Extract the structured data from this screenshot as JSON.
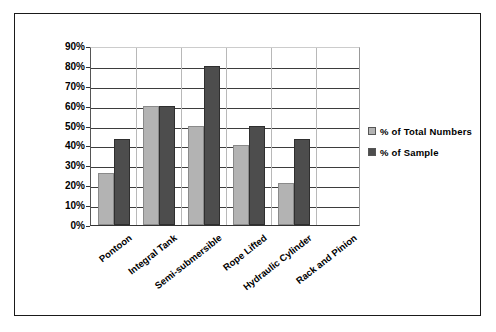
{
  "chart_data": {
    "type": "bar",
    "title": "",
    "xlabel": "",
    "ylabel": "",
    "categories": [
      "Pontoon",
      "Integral Tank",
      "Semi-submersible",
      "Rope Lifted",
      "Hydraulic Cylinder",
      "Rack and Pinion"
    ],
    "series": [
      {
        "name": "% of Total Numbers",
        "color": "#b3b3b3",
        "values": [
          26,
          60,
          50,
          40,
          21,
          0
        ]
      },
      {
        "name": "% of Sample",
        "color": "#4d4d4d",
        "values": [
          43,
          60,
          80,
          50,
          43,
          0
        ]
      }
    ],
    "ylim": [
      0,
      90
    ],
    "ytick_values": [
      0,
      10,
      20,
      30,
      40,
      50,
      60,
      70,
      80,
      90
    ],
    "ytick_labels": [
      "0%",
      "10%",
      "20%",
      "30%",
      "40%",
      "50%",
      "60%",
      "70%",
      "80%",
      "90%"
    ],
    "grid": true,
    "legend_position": "right"
  },
  "legend": {
    "items": [
      {
        "label": "% of Total Numbers"
      },
      {
        "label": "% of Sample"
      }
    ]
  }
}
